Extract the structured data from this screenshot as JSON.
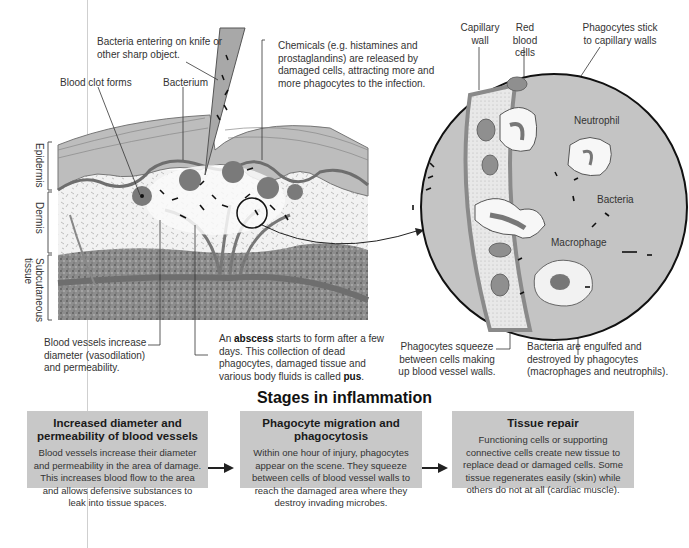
{
  "labels": {
    "bacteria_entering": "Bacteria entering on knife or other sharp object.",
    "chemicals": "Chemicals (e.g. histamines and prostaglandins) are released by damaged cells, attracting more and more phagocytes to the infection.",
    "blood_clot": "Blood clot forms",
    "bacterium": "Bacterium",
    "epidermis": "Epidermis",
    "dermis": "Dermis",
    "subcutaneous": "Subcutaneous tissue",
    "blood_vessels": "Blood vessels increase diameter (vasodilation) and permeability.",
    "abscess_pre": "An ",
    "abscess_bold": "abscess",
    "abscess_mid": " starts to form after a few days. This collection of dead phagocytes, damaged tissue and various body fluids is called ",
    "abscess_pus": "pus",
    "abscess_end": ".",
    "capillary_wall": "Capillary wall",
    "red_blood_cells": "Red blood cells",
    "phagocytes_stick": "Phagocytes stick to capillary walls",
    "neutrophil": "Neutrophil",
    "bacteria": "Bacteria",
    "macrophage": "Macrophage",
    "phagocytes_squeeze": "Phagocytes squeeze between cells making up blood vessel walls.",
    "bacteria_engulfed": "Bacteria are engulfed and destroyed by phagocytes (macrophages and neutrophils)."
  },
  "stages": {
    "title": "Stages in inflammation",
    "items": [
      {
        "title": "Increased diameter and permeability of blood vessels",
        "text": "Blood vessels increase their diameter and permeability in the area of damage. This increases blood flow to the area and allows defensive substances to leak into tissue spaces."
      },
      {
        "title": "Phagocyte migration and phagocytosis",
        "text": "Within one hour of injury, phagocytes appear on the scene. They squeeze between cells of blood vessel walls to reach the damaged area where they destroy invading microbes."
      },
      {
        "title": "Tissue repair",
        "text": "Functioning cells or supporting connective cells create new tissue to replace dead or damaged cells. Some tissue regenerates easily (skin) while others do not at all (cardiac muscle)."
      }
    ]
  },
  "colors": {
    "box_bg": "#c8c8c8",
    "tissue_dark": "#8a8a8a",
    "vessel": "#777777",
    "epidermis": "#bdbdbd",
    "inset_bg": "#c4c4c4"
  }
}
